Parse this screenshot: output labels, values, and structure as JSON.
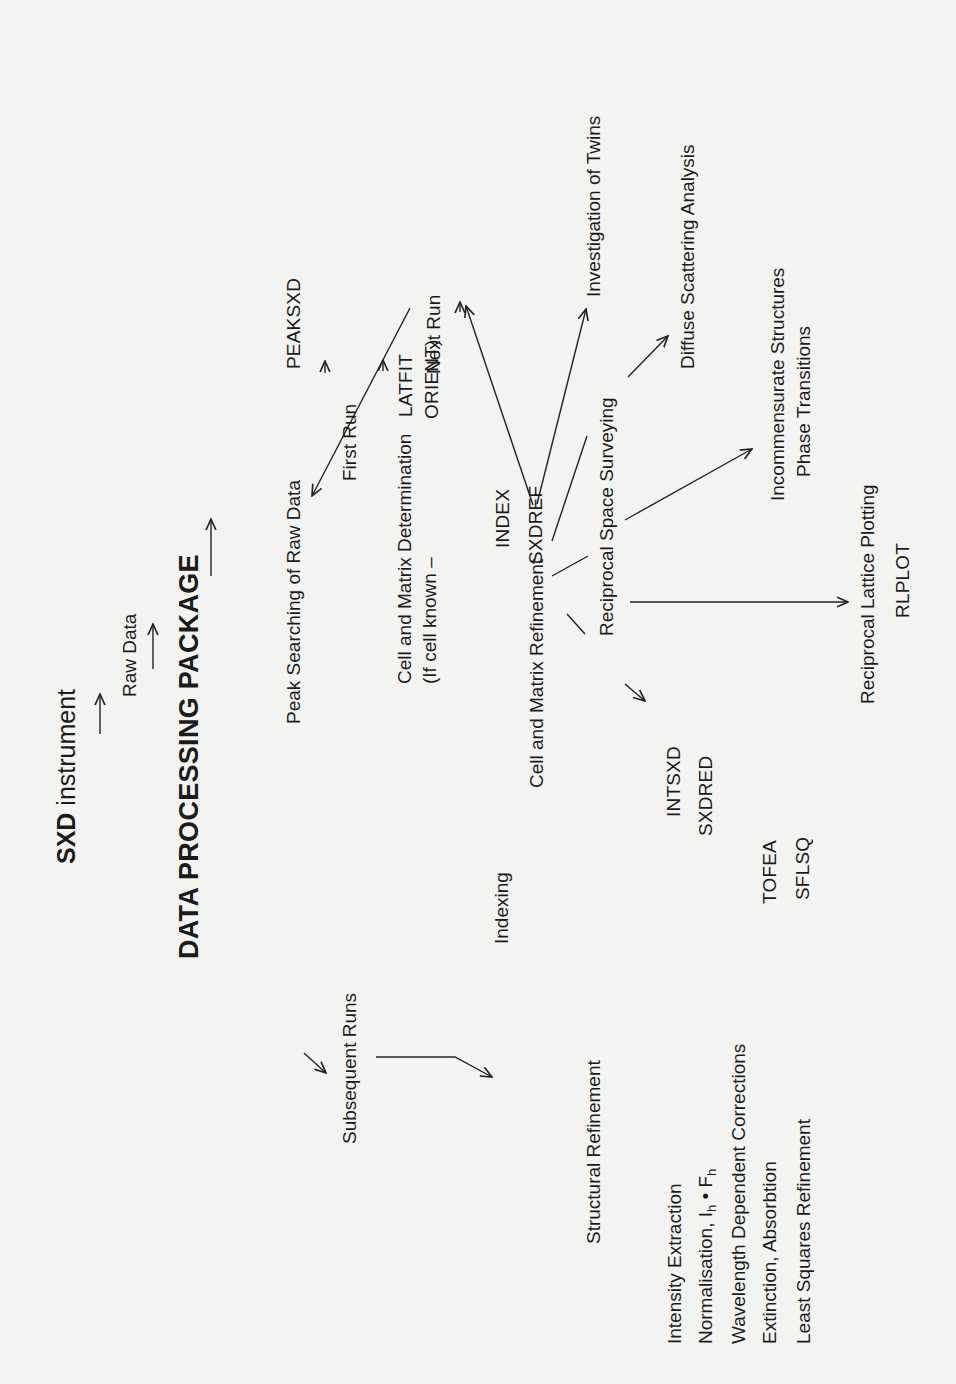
{
  "diagram": {
    "title": "DATA PROCESSING PACKAGE",
    "instrument": {
      "prefix": "SXD",
      "suffix": " instrument"
    },
    "raw_data": "Raw Data",
    "stages": {
      "peak_search": "Peak Searching of Raw Data",
      "first_run": "First Run",
      "subsequent_runs": "Subsequent Runs",
      "cell_matrix_det": "Cell and Matrix Determination",
      "if_cell_known": "(If cell known –",
      "indexing": "Indexing",
      "cell_matrix_ref": "Cell and Matrix Refinement",
      "structural_refinement": "Structural Refinement",
      "next_run": "Next Run",
      "reciprocal_space_surveying": "Reciprocal Space Surveying",
      "investigation_twins": "Investigation of Twins",
      "diffuse_scattering": "Diffuse Scattering Analysis",
      "incommensurate": "Incommensurate Structures",
      "phase_transitions": "Phase Transitions",
      "reciprocal_lattice_plotting": "Reciprocal Lattice Plotting"
    },
    "programs": {
      "peaksxd": "PEAKSXD",
      "latfit": "LATFIT",
      "orient": "ORIENT)",
      "index": "INDEX",
      "sxdref": "SXDREF",
      "rlplot": "RLPLOT",
      "intsxd": "INTSXD",
      "sxdred": "SXDRED",
      "tofea": "TOFEA",
      "sflsq": "SFLSQ"
    },
    "refinement_steps": {
      "intensity_extraction": "Intensity Extraction",
      "normalisation_prefix": "Normalisation, I",
      "normalisation_sub1": "h",
      "normalisation_mid": " • F",
      "normalisation_sub2": "h",
      "wavelength_corrections": "Wavelength Dependent Corrections",
      "extinction_absorbtion": "Extinction, Absorbtion",
      "least_squares": "Least Squares Refinement"
    }
  }
}
